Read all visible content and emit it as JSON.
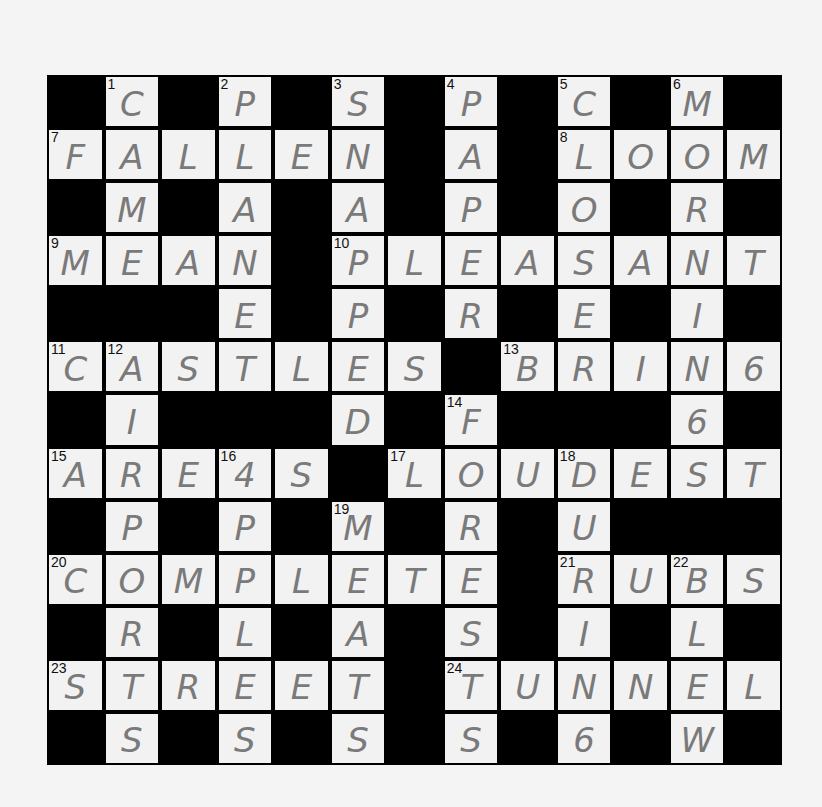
{
  "puzzle": {
    "rows": 13,
    "cols": 13,
    "grid": [
      "#C#P#S#P#C#M#",
      "FALLEN#A#LOOM",
      "#M#A#A#P#O#R#",
      "MEAN#PLEASANT",
      "###E#P#R#E#I#",
      "CASTLES#BRING",
      "#I###D#F###G#",
      "AREAS#LOUDEST",
      "#P#P#M#R#U###",
      "COMPLETE#RUBS",
      "#R#L#A#S#I#L#",
      "STREET#TUNNEL",
      "#S#S#S#S#G#W#"
    ],
    "numbers": [
      {
        "row": 0,
        "col": 1,
        "n": "1"
      },
      {
        "row": 0,
        "col": 3,
        "n": "2"
      },
      {
        "row": 0,
        "col": 5,
        "n": "3"
      },
      {
        "row": 0,
        "col": 7,
        "n": "4"
      },
      {
        "row": 0,
        "col": 9,
        "n": "5"
      },
      {
        "row": 0,
        "col": 11,
        "n": "6"
      },
      {
        "row": 1,
        "col": 0,
        "n": "7"
      },
      {
        "row": 1,
        "col": 9,
        "n": "8"
      },
      {
        "row": 3,
        "col": 0,
        "n": "9"
      },
      {
        "row": 3,
        "col": 5,
        "n": "10"
      },
      {
        "row": 5,
        "col": 0,
        "n": "11"
      },
      {
        "row": 5,
        "col": 1,
        "n": "12"
      },
      {
        "row": 5,
        "col": 8,
        "n": "13"
      },
      {
        "row": 6,
        "col": 7,
        "n": "14"
      },
      {
        "row": 7,
        "col": 0,
        "n": "15"
      },
      {
        "row": 7,
        "col": 3,
        "n": "16"
      },
      {
        "row": 7,
        "col": 6,
        "n": "17"
      },
      {
        "row": 7,
        "col": 9,
        "n": "18"
      },
      {
        "row": 8,
        "col": 5,
        "n": "19"
      },
      {
        "row": 9,
        "col": 0,
        "n": "20"
      },
      {
        "row": 9,
        "col": 9,
        "n": "21"
      },
      {
        "row": 9,
        "col": 11,
        "n": "22"
      },
      {
        "row": 11,
        "col": 0,
        "n": "23"
      },
      {
        "row": 11,
        "col": 7,
        "n": "24"
      }
    ],
    "handwritten_overrides": [
      {
        "row": 7,
        "col": 3,
        "shown": "4",
        "note": "handwritten A resembling 4"
      },
      {
        "row": 5,
        "col": 12,
        "shown": "6"
      },
      {
        "row": 6,
        "col": 11,
        "shown": "6"
      },
      {
        "row": 12,
        "col": 9,
        "shown": "6"
      }
    ],
    "answers_across": [
      {
        "n": "7",
        "answer": "FALLEN"
      },
      {
        "n": "8",
        "answer": "LOOM"
      },
      {
        "n": "9",
        "answer": "MEAN"
      },
      {
        "n": "10",
        "answer": "PLEASANT"
      },
      {
        "n": "11",
        "answer": "CASTLES"
      },
      {
        "n": "13",
        "answer": "BRING"
      },
      {
        "n": "15",
        "answer": "AREAS"
      },
      {
        "n": "17",
        "answer": "LOUDEST"
      },
      {
        "n": "20",
        "answer": "COMPLETE"
      },
      {
        "n": "21",
        "answer": "RUBS"
      },
      {
        "n": "23",
        "answer": "STREET"
      },
      {
        "n": "24",
        "answer": "TUNNEL"
      }
    ],
    "answers_down": [
      {
        "n": "1",
        "answer": "CAME"
      },
      {
        "n": "2",
        "answer": "PLANET"
      },
      {
        "n": "3",
        "answer": "SNAPPED"
      },
      {
        "n": "4",
        "answer": "PAPER"
      },
      {
        "n": "5",
        "answer": "CLOSER"
      },
      {
        "n": "6",
        "answer": "MORNING"
      },
      {
        "n": "12",
        "answer": "AIRPORTS"
      },
      {
        "n": "14",
        "answer": "FORKS"
      },
      {
        "n": "16",
        "answer": "APPLES"
      },
      {
        "n": "18",
        "answer": "DURING"
      },
      {
        "n": "19",
        "answer": "MEATS"
      },
      {
        "n": "22",
        "answer": "BLEW"
      }
    ]
  }
}
